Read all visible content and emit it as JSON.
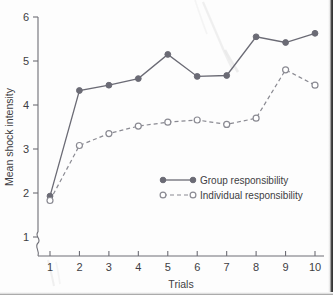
{
  "chart_data": {
    "type": "line",
    "title": "",
    "xlabel": "Trials",
    "ylabel": "Mean shock intensity",
    "x": [
      1,
      2,
      3,
      4,
      5,
      6,
      7,
      8,
      9,
      10
    ],
    "xticklabels": [
      "1",
      "2",
      "3",
      "4",
      "5",
      "6",
      "7",
      "8",
      "9",
      "10"
    ],
    "yticklabels": [
      "1",
      "2",
      "3",
      "4",
      "5",
      "6"
    ],
    "yticks": [
      1,
      2,
      3,
      4,
      5,
      6
    ],
    "xlim": [
      1,
      10
    ],
    "ylim": [
      1,
      6
    ],
    "grid": false,
    "axis_break": true,
    "legend_position": "center-right-inside",
    "series": [
      {
        "name": "Group responsibility",
        "marker": "filled-circle",
        "linestyle": "solid",
        "color": "#6b6b75",
        "values": [
          1.93,
          4.33,
          4.45,
          4.6,
          5.15,
          4.65,
          4.67,
          5.55,
          5.42,
          5.63
        ]
      },
      {
        "name": "Individual responsibility",
        "marker": "open-circle",
        "linestyle": "dashed",
        "color": "#8a8a92",
        "values": [
          1.83,
          3.08,
          3.35,
          3.52,
          3.61,
          3.66,
          3.56,
          3.7,
          4.8,
          4.45
        ]
      }
    ]
  },
  "legend": {
    "entries": [
      {
        "label": "Group responsibility"
      },
      {
        "label": "Individual responsibility"
      }
    ]
  },
  "axes": {
    "y_title": "Mean shock intensity",
    "x_title": "Trials"
  }
}
